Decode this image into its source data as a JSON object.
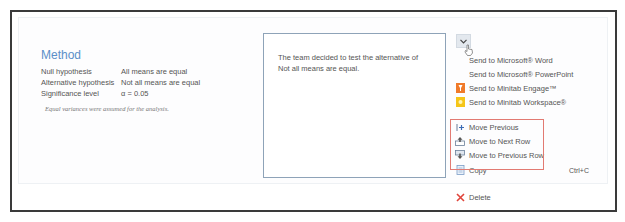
{
  "method": {
    "title": "Method",
    "rows": [
      {
        "label": "Null hypothesis",
        "value": "All means are equal"
      },
      {
        "label": "Alternative hypothesis",
        "value": "Not all means are equal"
      },
      {
        "label": "Significance level",
        "value": "α = 0.05"
      }
    ],
    "note": "Equal variances were assumed for the analysis."
  },
  "comment": {
    "text": "The team decided to test the alternative of Not all means are equal."
  },
  "dropdown": {
    "glyph": "⌄"
  },
  "menu": {
    "items": [
      {
        "label": "Send to Microsoft® Word",
        "icon": "none"
      },
      {
        "label": "Send to Microsoft® PowerPoint",
        "icon": "none"
      },
      {
        "label": "Send to Minitab Engage™",
        "icon": "minitab-engage-icon"
      },
      {
        "label": "Send to Minitab Workspace®",
        "icon": "minitab-workspace-icon"
      },
      {
        "label": "Move Previous",
        "icon": "move-previous-icon"
      },
      {
        "label": "Move to Next Row",
        "icon": "move-next-row-icon"
      },
      {
        "label": "Move to Previous Row",
        "icon": "move-previous-row-icon"
      },
      {
        "label": "Copy",
        "icon": "copy-icon",
        "shortcut": "Ctrl+C"
      },
      {
        "label": "Delete",
        "icon": "delete-icon"
      }
    ]
  },
  "colors": {
    "accent": "#5b8fc8",
    "highlight": "#e27a72",
    "delete": "#e0443a",
    "engage": "#f07a2a",
    "workspace": "#f5c518"
  }
}
